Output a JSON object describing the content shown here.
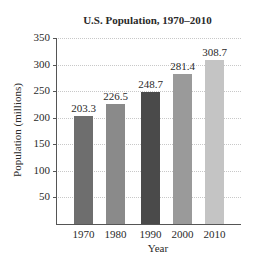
{
  "chart_data": {
    "type": "bar",
    "title": "U.S. Population, 1970–2010",
    "xlabel": "Year",
    "ylabel": "Population (millions)",
    "categories": [
      "1970",
      "1980",
      "1990",
      "2000",
      "2010"
    ],
    "values": [
      203.3,
      226.5,
      248.7,
      281.4,
      308.7
    ],
    "value_labels": [
      "203.3",
      "226.5",
      "248.7",
      "281.4",
      "308.7"
    ],
    "bar_colors": [
      "#6e6e6e",
      "#8a8a8a",
      "#4a4a4a",
      "#9a9a9a",
      "#c4c4c4"
    ],
    "ylim": [
      0,
      350
    ],
    "yticks": [
      50,
      100,
      150,
      200,
      250,
      300,
      350
    ],
    "ytick_labels": [
      "50",
      "100",
      "150",
      "200",
      "250",
      "300",
      "350"
    ],
    "grid": true,
    "legend": null
  }
}
